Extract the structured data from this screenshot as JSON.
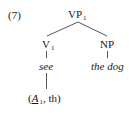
{
  "example": {
    "number": "(7)"
  },
  "tree": {
    "root": {
      "label": "VP",
      "subscript": "1"
    },
    "left": {
      "label": "V",
      "subscript": "1",
      "word": "see",
      "theta_grid": {
        "open": "(",
        "arg1": "A",
        "arg1_subscript": "1",
        "sep": ",",
        "arg2": "th",
        "close": ")"
      }
    },
    "right": {
      "label": "NP",
      "word": "the dog"
    }
  },
  "colors": {
    "ink": "#1a1a1a",
    "background": "#ffffff",
    "line": "#444444"
  }
}
